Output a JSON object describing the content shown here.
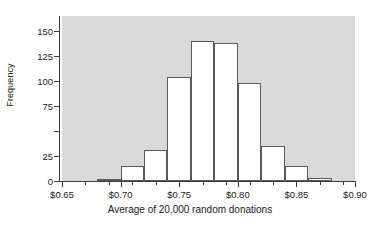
{
  "chart_data": {
    "type": "bar",
    "title": "",
    "xlabel": "Average of 20,000 random donations",
    "ylabel": "Frequency",
    "grid": false,
    "legend": false,
    "bin_width": 0.02,
    "bin_edges": [
      0.68,
      0.7,
      0.72,
      0.74,
      0.76,
      0.78,
      0.8,
      0.82,
      0.84,
      0.86,
      0.88
    ],
    "categories": [
      "0.68-0.70",
      "0.70-0.72",
      "0.72-0.74",
      "0.74-0.76",
      "0.76-0.78",
      "0.78-0.80",
      "0.80-0.82",
      "0.82-0.84",
      "0.84-0.86",
      "0.86-0.88"
    ],
    "values": [
      2,
      15,
      31,
      104,
      140,
      138,
      98,
      35,
      15,
      3
    ],
    "xlim": [
      0.65,
      0.9
    ],
    "ylim": [
      0,
      165
    ],
    "x_tick_values": [
      0.65,
      0.7,
      0.75,
      0.8,
      0.85,
      0.9
    ],
    "x_tick_labels": [
      "$0.65",
      "$0.70",
      "$0.75",
      "$0.80",
      "$0.85",
      "$0.90"
    ],
    "x_minor_tick_values": [
      0.67,
      0.69,
      0.71,
      0.73,
      0.77,
      0.79,
      0.81,
      0.83,
      0.87,
      0.89
    ],
    "y_tick_values": [
      0,
      25,
      50,
      75,
      100,
      125,
      150
    ],
    "y_tick_labels": [
      "0",
      "25",
      "",
      "75",
      "100",
      "125",
      "150"
    ],
    "colors": {
      "plot_background": "#d9d9d9",
      "figure_background": "#ffffff",
      "bar_fill": "#ffffff",
      "bar_edge": "#5a5a5a",
      "axis": "#3c3c3c",
      "text": "#1a1a1a"
    }
  }
}
